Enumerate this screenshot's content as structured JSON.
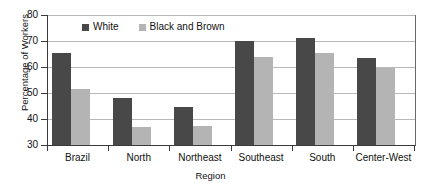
{
  "chart_data": {
    "type": "bar",
    "title": "",
    "xlabel": "Region",
    "ylabel": "Percentage of Workers",
    "categories": [
      "Brazil",
      "North",
      "Northeast",
      "Southeast",
      "South",
      "Center-West"
    ],
    "series": [
      {
        "name": "White",
        "color": "#484848",
        "values": [
          65.5,
          48.0,
          44.5,
          70.0,
          71.0,
          63.5
        ]
      },
      {
        "name": "Black and Brown",
        "color": "#b4b4b4",
        "values": [
          51.5,
          37.0,
          37.5,
          64.0,
          65.5,
          59.5
        ]
      }
    ],
    "ylim": [
      30,
      80
    ],
    "yticks": [
      30,
      40,
      50,
      60,
      70,
      80
    ],
    "ytick_labels": [
      "30",
      "40",
      "50",
      "60",
      "70",
      "80"
    ],
    "grid": true,
    "legend_position": "top-left-inside"
  }
}
